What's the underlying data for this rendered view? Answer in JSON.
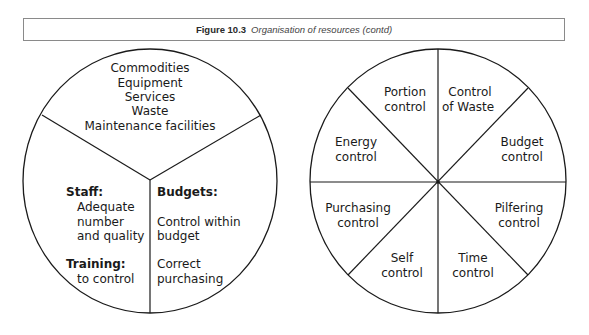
{
  "caption": {
    "label": "Figure 10.3",
    "title": "Organisation of resources (contd)"
  },
  "left_circle": {
    "top_segment": {
      "lines": [
        "Commodities",
        "Equipment",
        "Services",
        "Waste",
        "Maintenance facilities"
      ]
    },
    "left_segment": {
      "staff_heading": "Staff:",
      "staff_lines": [
        "Adequate",
        "number",
        "and quality"
      ],
      "training_heading": "Training:",
      "training_lines": [
        "to control"
      ]
    },
    "right_segment": {
      "budgets_heading": "Budgets:",
      "budget_lines": [
        "Control within",
        "budget",
        "Correct",
        "purchasing"
      ]
    }
  },
  "right_circle": {
    "segments": [
      {
        "line1": "Portion",
        "line2": "control"
      },
      {
        "line1": "Control",
        "line2": "of Waste"
      },
      {
        "line1": "Budget",
        "line2": "control"
      },
      {
        "line1": "Pilfering",
        "line2": "control"
      },
      {
        "line1": "Time",
        "line2": "control"
      },
      {
        "line1": "Self",
        "line2": "control"
      },
      {
        "line1": "Purchasing",
        "line2": "control"
      },
      {
        "line1": "Energy",
        "line2": "control"
      }
    ]
  }
}
